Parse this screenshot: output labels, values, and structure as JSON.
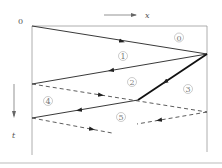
{
  "axes": {
    "origin_label": "0",
    "x_label": "x",
    "t_label": "t"
  },
  "regions": [
    {
      "id": "0",
      "label": "⓪",
      "x": 179,
      "y": 40
    },
    {
      "id": "1",
      "label": "①",
      "x": 123,
      "y": 58
    },
    {
      "id": "2",
      "label": "②",
      "x": 132,
      "y": 84
    },
    {
      "id": "3",
      "label": "③",
      "x": 188,
      "y": 90
    },
    {
      "id": "4",
      "label": "④",
      "x": 48,
      "y": 103
    },
    {
      "id": "5",
      "label": "⑤",
      "x": 121,
      "y": 118
    }
  ],
  "colors": {
    "line": "#222222",
    "frame": "#888888",
    "label": "#777777"
  }
}
